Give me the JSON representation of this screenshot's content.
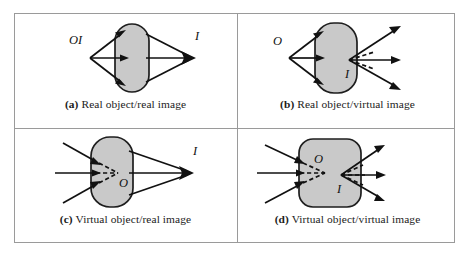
{
  "figure": {
    "panels": [
      {
        "id": "a",
        "tag": "(a)",
        "caption": "Real object/real image",
        "object_label": "O",
        "object_type": "real",
        "image_label": "I",
        "image_type": "real",
        "combined_label": "OI",
        "lens_shape": "stadium-tall",
        "incoming_rays": 3,
        "outgoing_rays": 3,
        "dashed_extensions": "none"
      },
      {
        "id": "b",
        "tag": "(b)",
        "caption": "Real object/virtual image",
        "object_label": "O",
        "object_type": "real",
        "image_label": "I",
        "image_type": "virtual",
        "lens_shape": "stadium-tall",
        "incoming_rays": 3,
        "outgoing_rays": 3,
        "dashed_extensions": "image-side"
      },
      {
        "id": "c",
        "tag": "(c)",
        "caption": "Virtual object/real image",
        "object_label": "O",
        "object_type": "virtual",
        "image_label": "I",
        "image_type": "real",
        "lens_shape": "stadium-tall",
        "incoming_rays": 3,
        "outgoing_rays": 3,
        "dashed_extensions": "object-side"
      },
      {
        "id": "d",
        "tag": "(d)",
        "caption": "Virtual object/virtual image",
        "object_label": "O",
        "object_type": "virtual",
        "image_label": "I",
        "image_type": "virtual",
        "lens_shape": "rounded-square",
        "incoming_rays": 3,
        "outgoing_rays": 3,
        "dashed_extensions": "both-sides"
      }
    ],
    "colors": {
      "lens_fill": "#c9c9c9",
      "lens_stroke": "#1e1e1e",
      "ray_stroke": "#111111",
      "frame_border": "#9a9a9a",
      "background": "#ffffff",
      "caption_text": "#1b1b1b"
    }
  }
}
